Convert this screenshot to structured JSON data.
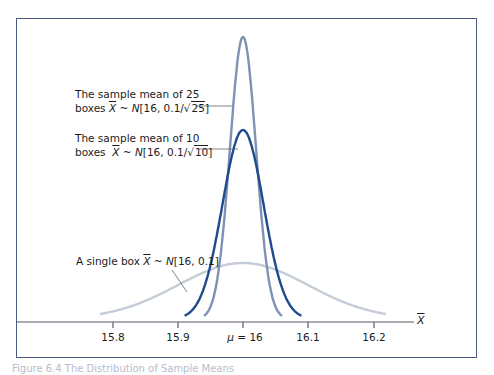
{
  "chart_data": {
    "type": "line",
    "title": "",
    "xlabel": "X̄",
    "ylabel": "",
    "x_ticks": [
      15.8,
      15.9,
      16.0,
      16.1,
      16.2
    ],
    "x_tick_labels": [
      "15.8",
      "15.9",
      "μ = 16",
      "16.1",
      "16.2"
    ],
    "xlim": [
      15.77,
      16.24
    ],
    "grid": false,
    "legend": "none (annotations with leader lines)",
    "series": [
      {
        "name": "The sample mean of 25 boxes X̄ ~ N[16, 0.1/√25]",
        "mean": 16,
        "sd": 0.02,
        "color": "#7f92b4",
        "x_range": [
          15.94,
          16.06
        ],
        "peak_y_px": 37
      },
      {
        "name": "The sample mean of 10 boxes X̄ ~ N[16, 0.1/√10]",
        "mean": 16,
        "sd": 0.0316,
        "color": "#1f4b8e",
        "x_range": [
          15.91,
          16.09
        ],
        "peak_y_px": 130
      },
      {
        "name": "A single box X̄ ~ N[16, 0.1]",
        "mean": 16,
        "sd": 0.1,
        "color": "#c3ccd8",
        "x_range": [
          15.78,
          16.22
        ],
        "peak_y_px": 263
      }
    ],
    "annotations": [
      {
        "line1": "The sample mean of 25",
        "prefix": "boxes ",
        "var": "X",
        "tilde": " ~ ",
        "dist": "N",
        "args": "[16, 0.1/",
        "root": "25",
        "close": "]"
      },
      {
        "line1": "The sample mean of 10",
        "prefix": "boxes  ",
        "var": "X",
        "tilde": " ~ ",
        "dist": "N",
        "args": "[16, 0.1/",
        "root": "10",
        "close": "]"
      },
      {
        "line1": "A single box ",
        "var": "X",
        "tilde": " ~ ",
        "dist": "N",
        "args": "[16, 0.1]"
      }
    ],
    "mu_symbol": "μ",
    "mu_rest": " = 16"
  },
  "caption": "Figure 6.4   The Distribution of Sample Means"
}
